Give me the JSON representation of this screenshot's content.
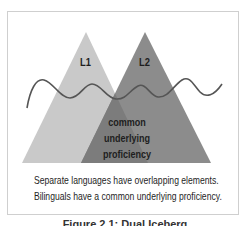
{
  "diagram": {
    "type": "dual-iceberg",
    "left_label": "L1",
    "right_label": "L2",
    "overlap_label_lines": [
      "common",
      "underlying",
      "proficiency"
    ],
    "description_lines": [
      "Separate languages have overlapping elements.",
      "Bilinguals have a common underlying proficiency."
    ],
    "caption": "Figure 2.1: Dual Iceberg",
    "colors": {
      "left_triangle": "#c9c9c9",
      "right_triangle": "#8c8c8c",
      "overlap": "#7c7c7c",
      "wave": "#555555",
      "frame_border": "#cfcfcf"
    }
  }
}
